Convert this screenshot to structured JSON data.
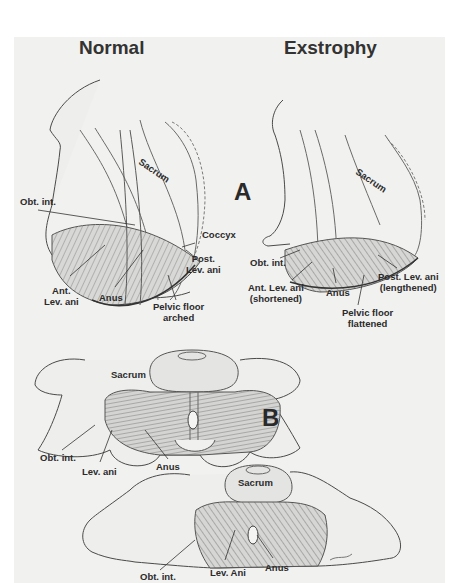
{
  "figure": {
    "titles": {
      "left": "Normal",
      "right": "Exstrophy"
    },
    "panels": {
      "a": "A",
      "b": "B"
    },
    "panel_a": {
      "normal": {
        "sacrum": "Sacrum",
        "obt_int": "Obt. int.",
        "coccyx": "Coccyx",
        "post_lev_ani": [
          "Post.",
          "Lev. ani"
        ],
        "ant_lev_ani": [
          "Ant.",
          "Lev. ani"
        ],
        "anus": "Anus",
        "pelvic_floor": [
          "Pelvic floor",
          "arched"
        ]
      },
      "exstrophy": {
        "sacrum": "Sacrum",
        "obt_int": "Obt. int.",
        "ant_lev_ani": [
          "Ant. Lev. ani",
          "(shortened)"
        ],
        "anus": "Anus",
        "post_lev_ani": [
          "Post. Lev. ani",
          "(lengthened)"
        ],
        "pelvic_floor": [
          "Pelvic floor",
          "flattened"
        ]
      }
    },
    "panel_b": {
      "normal": {
        "sacrum": "Sacrum",
        "obt_int": "Obt. int.",
        "lev_ani": "Lev. ani",
        "anus": "Anus"
      },
      "exstrophy": {
        "sacrum": "Sacrum",
        "obt_int": "Obt. int.",
        "lev_ani": "Lev. Ani",
        "anus": "Anus"
      }
    },
    "colors": {
      "background": "#f1f1ef",
      "ink": "#2b2b2b",
      "line": "#555555"
    }
  }
}
